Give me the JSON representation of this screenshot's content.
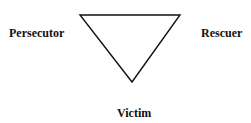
{
  "diagram": {
    "type": "drama-triangle",
    "nodes": {
      "top_left": "Persecutor",
      "top_right": "Rescuer",
      "bottom": "Victim"
    },
    "shape": "inverted-triangle",
    "stroke_color": "#111111"
  }
}
